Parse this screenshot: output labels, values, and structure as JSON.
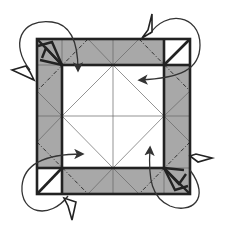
{
  "diagram": {
    "title": "Origami fold diagram: fold corners and edges inward",
    "colors": {
      "paper_colored": "#a8a8a8",
      "paper_white": "#ffffff",
      "outline": "#222222",
      "crease": "#555555",
      "arrow": "#333333"
    },
    "outer_square": {
      "x1": 37,
      "y1": 39,
      "x2": 190,
      "y2": 194
    },
    "inner_square": {
      "x1": 62,
      "y1": 65,
      "x2": 164,
      "y2": 168
    },
    "center": {
      "x": 113,
      "y": 116
    },
    "corners": [
      {
        "name": "top-left",
        "style": "fan-pleat",
        "dashed_valley": true
      },
      {
        "name": "top-right",
        "style": "diagonal-triangle",
        "dashed_valley": true
      },
      {
        "name": "bottom-left",
        "style": "diagonal-triangle",
        "dashed_valley": true
      },
      {
        "name": "bottom-right",
        "style": "fan-pleat",
        "dashed_valley": true
      }
    ],
    "arrows": [
      {
        "name": "fold-arrow-top-left",
        "direction": "down"
      },
      {
        "name": "fold-arrow-top-right",
        "direction": "left"
      },
      {
        "name": "fold-arrow-bottom-left",
        "direction": "right"
      },
      {
        "name": "fold-arrow-bottom-right",
        "direction": "up"
      }
    ],
    "caption": "Fold each edge inward along the valley folds"
  }
}
